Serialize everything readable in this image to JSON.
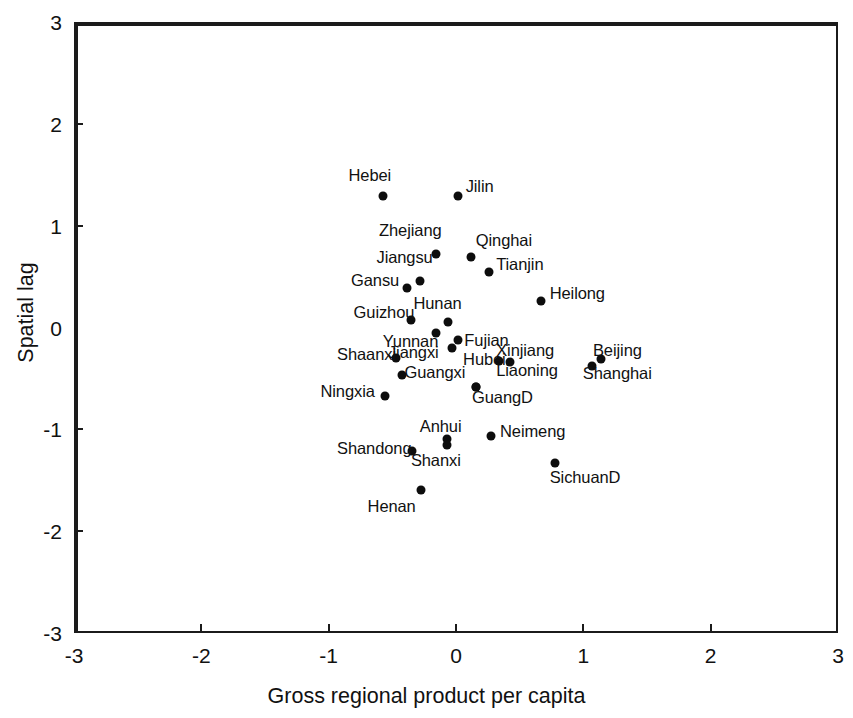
{
  "chart_data": {
    "type": "scatter",
    "title": "",
    "xlabel": "Gross regional product per capita",
    "ylabel": "Spatial lag",
    "xlim": [
      -3,
      3
    ],
    "ylim": [
      -3,
      3
    ],
    "xticks": [
      -3,
      -2,
      -1,
      0,
      1,
      2,
      3
    ],
    "yticks": [
      -3,
      -2,
      -1,
      0,
      1,
      2,
      3
    ],
    "xticklabels": [
      "-3",
      "-2",
      "-1",
      "0",
      "1",
      "2",
      "3"
    ],
    "yticklabels": [
      "-3",
      "-2",
      "-1",
      "0",
      "1",
      "2",
      "3"
    ],
    "grid": false,
    "legend": false,
    "reference_lines": {
      "x": 0,
      "y": 0
    },
    "marker_color": "#0d0d0d",
    "axis_color": "#1b1b1b",
    "points": [
      {
        "label": "Hebei",
        "x": -0.59,
        "y": 1.31,
        "lx": -0.86,
        "ly": 1.52
      },
      {
        "label": "Jilin",
        "x": 0.0,
        "y": 1.31,
        "lx": 0.06,
        "ly": 1.41
      },
      {
        "label": "Zhejiang",
        "x": -0.17,
        "y": 0.74,
        "lx": -0.62,
        "ly": 0.98
      },
      {
        "label": "Qinghai",
        "x": 0.1,
        "y": 0.71,
        "lx": 0.14,
        "ly": 0.88
      },
      {
        "label": "Jiangsu",
        "x": -0.3,
        "y": 0.48,
        "lx": -0.64,
        "ly": 0.71
      },
      {
        "label": "Tianjin",
        "x": 0.24,
        "y": 0.56,
        "lx": 0.3,
        "ly": 0.64
      },
      {
        "label": "Gansu",
        "x": -0.4,
        "y": 0.41,
        "lx": -0.84,
        "ly": 0.49
      },
      {
        "label": "Heilong",
        "x": 0.65,
        "y": 0.28,
        "lx": 0.72,
        "ly": 0.36
      },
      {
        "label": "Hunan",
        "x": -0.08,
        "y": 0.07,
        "lx": -0.35,
        "ly": 0.26
      },
      {
        "label": "Guizhou",
        "x": -0.37,
        "y": 0.09,
        "lx": -0.82,
        "ly": 0.17
      },
      {
        "label": "Yunnan",
        "x": -0.17,
        "y": -0.03,
        "lx": -0.59,
        "ly": -0.11
      },
      {
        "label": "Fujian",
        "x": 0.0,
        "y": -0.1,
        "lx": 0.05,
        "ly": -0.1
      },
      {
        "label": "Jiangxi",
        "x": -0.05,
        "y": -0.18,
        "lx": -0.55,
        "ly": -0.22
      },
      {
        "label": "Xinjiang",
        "x": 0.41,
        "y": -0.32,
        "lx": 0.3,
        "ly": -0.2
      },
      {
        "label": "Shaanxi",
        "x": -0.49,
        "y": -0.28,
        "lx": -0.95,
        "ly": -0.24
      },
      {
        "label": "Hubei",
        "x": 0.32,
        "y": -0.31,
        "lx": 0.04,
        "ly": -0.29
      },
      {
        "label": "Beijing",
        "x": 1.12,
        "y": -0.29,
        "lx": 1.06,
        "ly": -0.2
      },
      {
        "label": "Guangxi",
        "x": -0.44,
        "y": -0.45,
        "lx": -0.42,
        "ly": -0.42
      },
      {
        "label": "Liaoning",
        "x": 0.14,
        "y": -0.56,
        "lx": 0.3,
        "ly": -0.4
      },
      {
        "label": "Shanghai",
        "x": 1.05,
        "y": -0.36,
        "lx": 0.98,
        "ly": -0.43
      },
      {
        "label": "Ningxia",
        "x": -0.57,
        "y": -0.65,
        "lx": -1.08,
        "ly": -0.6
      },
      {
        "label": "GuangD",
        "x": 0.14,
        "y": -0.56,
        "lx": 0.11,
        "ly": -0.66
      },
      {
        "label": "Anhui",
        "x": -0.09,
        "y": -1.08,
        "lx": -0.3,
        "ly": -0.95
      },
      {
        "label": "Neimeng",
        "x": 0.26,
        "y": -1.05,
        "lx": 0.33,
        "ly": -1.0
      },
      {
        "label": "Shandong",
        "x": -0.36,
        "y": -1.19,
        "lx": -0.95,
        "ly": -1.16
      },
      {
        "label": "Shanxi",
        "x": -0.09,
        "y": -1.13,
        "lx": -0.37,
        "ly": -1.28
      },
      {
        "label": "SichuanD",
        "x": 0.76,
        "y": -1.31,
        "lx": 0.72,
        "ly": -1.45
      },
      {
        "label": "Henan",
        "x": -0.29,
        "y": -1.58,
        "lx": -0.71,
        "ly": -1.73
      }
    ]
  }
}
